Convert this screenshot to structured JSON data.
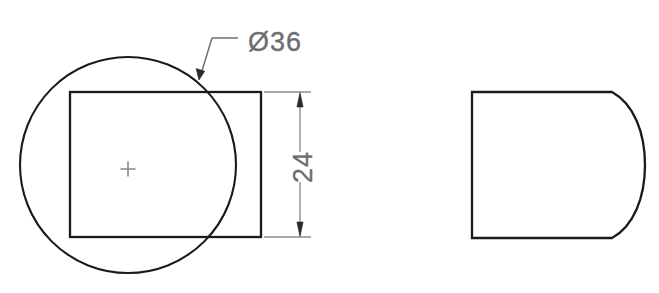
{
  "drawing": {
    "type": "engineering-orthographic-drawing",
    "views": [
      {
        "name": "front-view",
        "description": "Circle overlapped by square with center mark",
        "elements": {
          "circle": {
            "center_x": 128,
            "center_y": 165,
            "radius": 108
          },
          "square": {
            "x": 70,
            "y": 92,
            "width": 191,
            "height": 145
          },
          "center_mark": {
            "x": 128,
            "y": 169,
            "size": 15
          }
        }
      },
      {
        "name": "side-view",
        "description": "D-shaped profile with flat left side and convex right arc",
        "elements": {
          "profile": {
            "left_x": 472,
            "top_y": 92,
            "bottom_y": 238,
            "arc_start_x": 612,
            "arc_max_x": 645
          }
        }
      }
    ],
    "dimensions": [
      {
        "id": "diameter-callout",
        "label": "Ø36",
        "value": "36",
        "symbol": "Ø",
        "type": "diameter",
        "text_x": 248,
        "text_y": 50,
        "leader": {
          "shelf_start_x": 238,
          "shelf_end_x": 210,
          "shelf_y": 38,
          "tip_x": 199,
          "tip_y": 79
        }
      },
      {
        "id": "height-dimension",
        "label": "24",
        "value": "24",
        "type": "linear-vertical",
        "text_x": 300,
        "text_y": 172,
        "line_x": 300,
        "line_top_y": 92,
        "line_bottom_y": 237,
        "ext_line_top": {
          "x1": 264,
          "x2": 311,
          "y": 92
        },
        "ext_line_bottom": {
          "x1": 264,
          "x2": 311,
          "y": 237
        }
      }
    ],
    "colors": {
      "outline": "#1a1a1a",
      "dimension": "#7a7a7a",
      "center_mark": "#8a8a8a",
      "background": "#ffffff",
      "text": "#6e6e6e"
    }
  }
}
